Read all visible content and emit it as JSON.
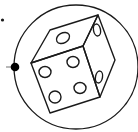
{
  "icon": {
    "name": "dice-in-circle",
    "description": "Line drawing of a six-sided die inside a circle",
    "colors": {
      "background": "#ffffff",
      "stroke": "#1a1a1a",
      "knob": "#000000",
      "knob_line": "#9a9a9a"
    },
    "visible_faces": {
      "top_pips": 1,
      "front_pips": 4,
      "right_pips": 2
    }
  }
}
